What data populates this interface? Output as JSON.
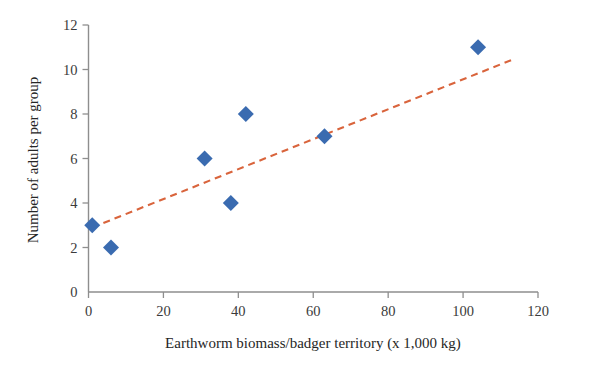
{
  "chart_data": {
    "type": "scatter",
    "title": "",
    "xlabel": "Earthworm biomass/badger territory (x 1,000 kg)",
    "ylabel": "Number of adults per group",
    "xlim": [
      0,
      120
    ],
    "ylim": [
      0,
      12
    ],
    "xticks": [
      0,
      20,
      40,
      60,
      80,
      100,
      120
    ],
    "yticks": [
      0,
      2,
      4,
      6,
      8,
      10,
      12
    ],
    "xtick_labels": [
      "0",
      "20",
      "40",
      "60",
      "80",
      "100",
      "120"
    ],
    "ytick_labels": [
      "0",
      "2",
      "4",
      "6",
      "8",
      "10",
      "12"
    ],
    "grid": false,
    "legend": false,
    "series": [
      {
        "name": "Badger groups",
        "marker": "diamond",
        "color": "#3a6bb0",
        "points": [
          {
            "x": 1,
            "y": 3
          },
          {
            "x": 6,
            "y": 2
          },
          {
            "x": 31,
            "y": 6
          },
          {
            "x": 38,
            "y": 4
          },
          {
            "x": 42,
            "y": 8
          },
          {
            "x": 63,
            "y": 7
          },
          {
            "x": 104,
            "y": 11
          }
        ]
      }
    ],
    "trendline": {
      "name": "Linear trend",
      "style": "dashed",
      "color": "#d9643c",
      "x_start": 1,
      "y_start": 2.9,
      "x_end": 114,
      "y_end": 10.5
    }
  },
  "axes": {
    "axis_color": "#8e8e8e",
    "text_color": "#262626"
  },
  "figure": {
    "background": "#ffffff",
    "width": 591,
    "height": 365
  }
}
